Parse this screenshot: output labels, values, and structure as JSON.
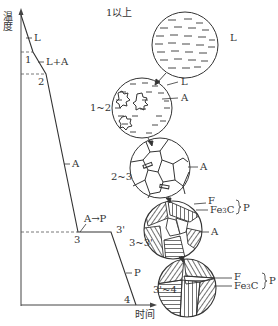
{
  "axes": {
    "y_label": "温度",
    "x_label": "时间"
  },
  "curve": {
    "points": [
      "1",
      "2",
      "3",
      "3'",
      "4"
    ],
    "segment_labels": [
      "L",
      "L+A",
      "A",
      "A→P",
      "P"
    ]
  },
  "microstructures": [
    {
      "stage": "1以上",
      "labels": [
        "L"
      ]
    },
    {
      "stage": "1~2",
      "labels": [
        "L",
        "A"
      ]
    },
    {
      "stage": "2~3",
      "labels": [
        "A"
      ]
    },
    {
      "stage": "3~3'",
      "labels": [
        "F",
        "Fe3C",
        "P",
        "A"
      ]
    },
    {
      "stage": "3'~4",
      "labels": [
        "F",
        "Fe3C",
        "P"
      ]
    }
  ],
  "colors": {
    "line": "#333333",
    "background": "#ffffff"
  }
}
